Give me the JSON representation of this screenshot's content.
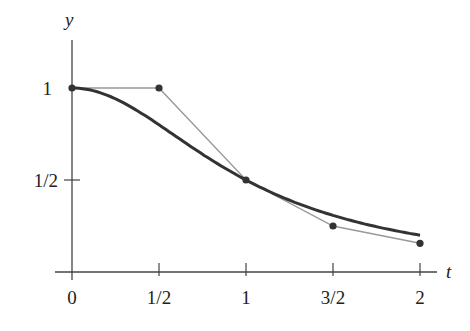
{
  "chart_data": {
    "type": "line",
    "title": "",
    "xlabel": "t",
    "ylabel": "y",
    "xlim": [
      0,
      2
    ],
    "ylim": [
      0,
      1
    ],
    "x_ticks": [
      "0",
      "1/2",
      "1",
      "3/2",
      "2"
    ],
    "y_ticks": [
      "1/2",
      "1"
    ],
    "grid": false,
    "series": [
      {
        "name": "exact solution y = 1/(1+t^2)",
        "style": "thick dark curve",
        "x": [
          0,
          0.25,
          0.5,
          0.75,
          1,
          1.25,
          1.5,
          1.75,
          2
        ],
        "values": [
          1,
          0.941,
          0.8,
          0.64,
          0.5,
          0.39,
          0.308,
          0.246,
          0.2
        ]
      },
      {
        "name": "Euler approximation (h = 1/2)",
        "style": "thin gray polyline with dots",
        "x": [
          0,
          0.5,
          1,
          1.5,
          2
        ],
        "values": [
          1,
          1,
          0.5,
          0.25,
          0.156
        ]
      }
    ]
  },
  "axes": {
    "x_label": "t",
    "y_label": "y",
    "x_tick_labels": [
      "0",
      "1/2",
      "1",
      "3/2",
      "2"
    ],
    "y_tick_labels": [
      "1",
      "1/2"
    ]
  },
  "colors": {
    "curve": "#333333",
    "polyline": "#999999",
    "axis": "#444444"
  }
}
